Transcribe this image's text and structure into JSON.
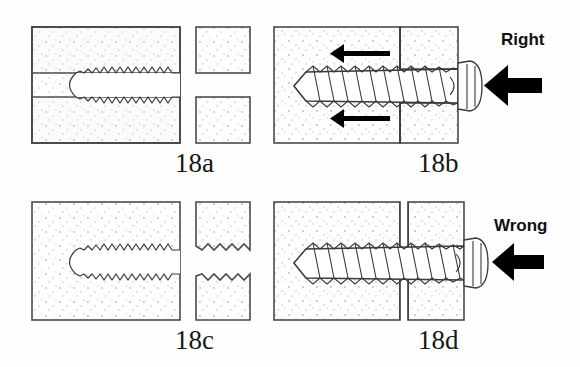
{
  "figure": {
    "background_color": "#fefefe",
    "bone_fill_color": "#fbfbfb",
    "bone_outline_color": "#4a4a4a",
    "ink_color": "#000000",
    "stipple_color": "#b9b9c2"
  },
  "panels": [
    {
      "id": "18a",
      "label": "18a",
      "caption_position": "below-right",
      "description": "Near fragment drilled as a smooth gliding hole, far fragment tapped with thread",
      "annotation": "",
      "fragments": [
        {
          "name": "far-fragment",
          "threaded": true,
          "split": false
        },
        {
          "name": "near-fragment-upper",
          "threaded": false,
          "split": true
        },
        {
          "name": "near-fragment-lower",
          "threaded": false,
          "split": true
        }
      ],
      "screw_present": false,
      "gap_visible": true,
      "compression_arrows": 0
    },
    {
      "id": "18b",
      "label": "18b",
      "caption_position": "below-right",
      "description": "Screw inserted; head presses near cortex, threads grip far fragment only, fracture compressed",
      "annotation": "Right",
      "fragments": [
        {
          "name": "far-fragment",
          "threaded": true,
          "split": false
        },
        {
          "name": "near-fragment",
          "threaded": false,
          "split": false
        }
      ],
      "screw_present": true,
      "gap_visible": false,
      "compression_arrows": 2,
      "insertion_arrow": true
    },
    {
      "id": "18c",
      "label": "18c",
      "caption_position": "below-right",
      "description": "Both fragments tapped with thread — no gliding hole in the near fragment",
      "annotation": "",
      "fragments": [
        {
          "name": "far-fragment",
          "threaded": true,
          "split": false
        },
        {
          "name": "near-fragment-upper",
          "threaded": true,
          "split": true
        },
        {
          "name": "near-fragment-lower",
          "threaded": true,
          "split": true
        }
      ],
      "screw_present": false,
      "gap_visible": true,
      "compression_arrows": 0
    },
    {
      "id": "18d",
      "label": "18d",
      "caption_position": "below-right",
      "description": "Screw threads engage both fragments; fracture gap persists, no compression achieved",
      "annotation": "Wrong",
      "fragments": [
        {
          "name": "far-fragment",
          "threaded": true,
          "split": false
        },
        {
          "name": "near-fragment",
          "threaded": true,
          "split": false
        }
      ],
      "screw_present": true,
      "gap_visible": true,
      "compression_arrows": 0,
      "insertion_arrow": true
    }
  ],
  "annotations": {
    "right_label": "Right",
    "wrong_label": "Wrong"
  },
  "labels": {
    "a": "18a",
    "b": "18b",
    "c": "18c",
    "d": "18d"
  }
}
